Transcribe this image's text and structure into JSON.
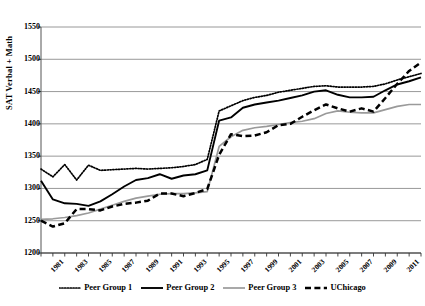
{
  "chart_data": {
    "type": "line",
    "title": "",
    "xlabel": "",
    "ylabel": "SAT Verbal + Math",
    "ylim": [
      1200,
      1550
    ],
    "ytick_step": 50,
    "yticks": [
      1200,
      1250,
      1300,
      1350,
      1400,
      1450,
      1500,
      1550
    ],
    "grid": true,
    "legend_position": "bottom",
    "x": [
      1981,
      1982,
      1983,
      1984,
      1985,
      1986,
      1987,
      1988,
      1989,
      1990,
      1991,
      1992,
      1993,
      1994,
      1995,
      1996,
      1997,
      1998,
      1999,
      2000,
      2001,
      2002,
      2003,
      2004,
      2005,
      2006,
      2007,
      2008,
      2009,
      2010,
      2011,
      2012,
      2013
    ],
    "xtick_labels": [
      "1981",
      "1983",
      "1985",
      "1987",
      "1989",
      "1991",
      "1993",
      "1995",
      "1997",
      "1999",
      "2001",
      "2003",
      "2005",
      "2007",
      "2009",
      "2011",
      "2013"
    ],
    "series": [
      {
        "name": "Peer Group 1",
        "style": "dotted",
        "color": "#000000",
        "values": [
          1330,
          1318,
          1337,
          1313,
          1336,
          1328,
          1329,
          1330,
          1331,
          1330,
          1331,
          1332,
          1334,
          1337,
          1345,
          1420,
          1428,
          1436,
          1441,
          1444,
          1449,
          1452,
          1455,
          1458,
          1459,
          1457,
          1457,
          1457,
          1458,
          1462,
          1468,
          1473,
          1478
        ]
      },
      {
        "name": "Peer Group 2",
        "style": "solid",
        "color": "#000000",
        "values": [
          1312,
          1283,
          1277,
          1276,
          1273,
          1280,
          1291,
          1303,
          1313,
          1316,
          1322,
          1315,
          1320,
          1322,
          1328,
          1405,
          1410,
          1425,
          1430,
          1433,
          1436,
          1440,
          1444,
          1450,
          1452,
          1445,
          1441,
          1441,
          1442,
          1452,
          1461,
          1466,
          1472
        ]
      },
      {
        "name": "Peer Group 3",
        "style": "solid-gray",
        "color": "#9a9a9a",
        "values": [
          1252,
          1253,
          1255,
          1258,
          1262,
          1268,
          1274,
          1280,
          1285,
          1288,
          1291,
          1292,
          1292,
          1293,
          1295,
          1365,
          1380,
          1390,
          1394,
          1396,
          1399,
          1402,
          1404,
          1408,
          1416,
          1420,
          1418,
          1417,
          1417,
          1422,
          1427,
          1430,
          1430
        ]
      },
      {
        "name": "UChicago",
        "style": "dashed",
        "color": "#000000",
        "values": [
          1250,
          1241,
          1246,
          1268,
          1268,
          1266,
          1272,
          1276,
          1278,
          1281,
          1292,
          1292,
          1288,
          1293,
          1299,
          1352,
          1384,
          1381,
          1382,
          1387,
          1398,
          1400,
          1411,
          1421,
          1430,
          1424,
          1419,
          1424,
          1419,
          1440,
          1462,
          1482,
          1495
        ]
      }
    ]
  },
  "legend": {
    "items": [
      {
        "label": "Peer Group 1"
      },
      {
        "label": "Peer Group 2"
      },
      {
        "label": "Peer Group 3"
      },
      {
        "label": "UChicago"
      }
    ]
  }
}
